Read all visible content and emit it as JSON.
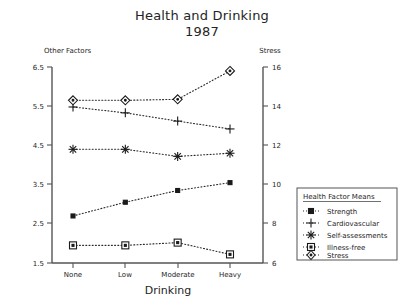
{
  "chart_data": {
    "type": "line",
    "title": "Health and Drinking",
    "subtitle": "1987",
    "xlabel": "Drinking",
    "ylabel_left": "Other Factors",
    "ylabel_right": "Stress",
    "categories": [
      "None",
      "Low",
      "Moderate",
      "Heavy"
    ],
    "left_axis": {
      "ticks": [
        "1.5",
        "2.5",
        "3.5",
        "4.5",
        "5.5",
        "6.5"
      ],
      "ylim": [
        1.5,
        6.5
      ]
    },
    "right_axis": {
      "ticks": [
        "6",
        "8",
        "10",
        "12",
        "14",
        "16"
      ],
      "ylim": [
        6,
        16
      ]
    },
    "grid": false,
    "legend_position": "right-inside",
    "legend_title": "Health Factor Means",
    "series": [
      {
        "name": "Strength",
        "marker": "small-solid-square",
        "axis": "left",
        "values": [
          2.7,
          3.05,
          3.35,
          3.55
        ]
      },
      {
        "name": "Cardiovascular",
        "marker": "plus",
        "axis": "left",
        "values": [
          5.48,
          5.33,
          5.12,
          4.92
        ]
      },
      {
        "name": "Self-assessments",
        "marker": "asterisk",
        "axis": "left",
        "values": [
          4.4,
          4.4,
          4.22,
          4.3
        ]
      },
      {
        "name": "Illness-free",
        "marker": "open-square",
        "axis": "left",
        "values": [
          1.95,
          1.95,
          2.02,
          1.72
        ]
      },
      {
        "name": "Stress",
        "marker": "diamond",
        "axis": "right",
        "values": [
          14.3,
          14.3,
          14.35,
          15.8
        ]
      }
    ]
  }
}
